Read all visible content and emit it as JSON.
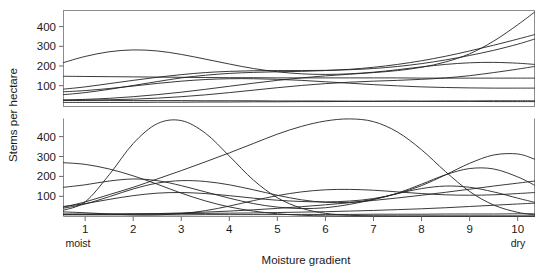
{
  "figure": {
    "title": "",
    "ylabel": "Stems per hectare",
    "xlabel": "Moisture gradient",
    "x_start_label": "moist",
    "x_end_label": "dry",
    "curve_color": "#232323",
    "frame_color": "#8d8d8d",
    "background": "#ffffff"
  },
  "axis": {
    "x_ticks": [
      "1",
      "2",
      "3",
      "4",
      "5",
      "6",
      "7",
      "8",
      "9",
      "10"
    ],
    "y_ticks_top": [
      "100",
      "200",
      "300",
      "400"
    ],
    "y_ticks_bottom": [
      "100",
      "200",
      "300",
      "400"
    ]
  },
  "chart_data": {
    "type": "line",
    "title": "",
    "xlabel": "Moisture gradient",
    "ylabel": "Stems per hectare",
    "xlim": [
      0.55,
      10.35
    ],
    "ylim": [
      0,
      470
    ],
    "grid": false,
    "legend": null,
    "x_tick_labels": [
      "1",
      "2",
      "3",
      "4",
      "5",
      "6",
      "7",
      "8",
      "9",
      "10"
    ],
    "x_tick_values": [
      1,
      2,
      3,
      4,
      5,
      6,
      7,
      8,
      9,
      10
    ],
    "x_axis_endpoints": {
      "left": "moist",
      "right": "dry"
    },
    "panels": [
      {
        "panel": "top",
        "ylim": [
          0,
          470
        ],
        "y_tick_values": [
          100,
          200,
          300,
          400
        ],
        "x": [
          0.55,
          1,
          1.5,
          2,
          2.5,
          3,
          3.5,
          4,
          4.5,
          5,
          5.5,
          6,
          6.5,
          7,
          7.5,
          8,
          8.5,
          9,
          9.5,
          10,
          10.35
        ],
        "series": [
          {
            "name": "top-curve-1",
            "values": [
              215,
              245,
              268,
              277,
              272,
              255,
              232,
              208,
              186,
              170,
              160,
              157,
              160,
              168,
              180,
              194,
              206,
              214,
              216,
              212,
              206
            ]
          },
          {
            "name": "top-curve-2",
            "values": [
              148,
              147,
              146,
              145,
              144,
              143,
              142,
              141,
              141,
              140,
              140,
              140,
              140,
              140,
              140,
              139,
              139,
              139,
              139,
              139,
              139
            ]
          },
          {
            "name": "top-curve-3",
            "values": [
              85,
              96,
              112,
              128,
              143,
              156,
              166,
              172,
              175,
              176,
              176,
              177,
              180,
              186,
              196,
              210,
              228,
              250,
              275,
              305,
              330
            ]
          },
          {
            "name": "top-curve-4",
            "values": [
              58,
              68,
              84,
              103,
              122,
              140,
              153,
              162,
              167,
              170,
              172,
              176,
              182,
              192,
              206,
              224,
              246,
              272,
              300,
              330,
              352
            ]
          },
          {
            "name": "top-curve-5",
            "values": [
              32,
              35,
              40,
              48,
              58,
              70,
              84,
              99,
              114,
              128,
              140,
              150,
              158,
              166,
              176,
              192,
              218,
              258,
              320,
              400,
              462
            ]
          },
          {
            "name": "top-curve-6",
            "values": [
              30,
              31,
              33,
              36,
              41,
              48,
              57,
              68,
              80,
              92,
              103,
              112,
              119,
              124,
              128,
              133,
              140,
              151,
              166,
              183,
              196
            ]
          },
          {
            "name": "top-curve-7",
            "values": [
              72,
              78,
              88,
              100,
              113,
              124,
              132,
              136,
              136,
              133,
              128,
              121,
              114,
              107,
              101,
              96,
              93,
              91,
              90,
              90,
              90
            ]
          },
          {
            "name": "top-curve-8",
            "values": [
              20,
              20,
              20,
              20,
              21,
              21,
              22,
              22,
              23,
              23,
              24,
              24,
              25,
              25,
              26,
              26,
              27,
              27,
              28,
              28,
              28
            ]
          },
          {
            "name": "top-curve-9",
            "values": [
              30,
              30,
              30,
              29,
              29,
              29,
              28,
              28,
              28,
              27,
              27,
              27,
              26,
              26,
              26,
              25,
              25,
              25,
              24,
              24,
              24
            ]
          }
        ]
      },
      {
        "panel": "bottom",
        "ylim": [
          0,
          470
        ],
        "y_tick_values": [
          100,
          200,
          300,
          400
        ],
        "x": [
          0.55,
          1,
          1.5,
          2,
          2.5,
          3,
          3.5,
          4,
          4.5,
          5,
          5.5,
          6,
          6.5,
          7,
          7.5,
          8,
          8.5,
          9,
          9.5,
          10,
          10.35
        ],
        "series": [
          {
            "name": "bottom-curve-1",
            "values": [
              30,
              70,
              200,
              350,
              445,
              460,
              400,
              290,
              175,
              90,
              40,
              15,
              6,
              3,
              2,
              2,
              2,
              2,
              2,
              2,
              2
            ]
          },
          {
            "name": "bottom-curve-2",
            "values": [
              45,
              70,
              105,
              140,
              180,
              220,
              262,
              305,
              350,
              395,
              432,
              458,
              468,
              455,
              405,
              320,
              215,
              120,
              55,
              20,
              8
            ]
          },
          {
            "name": "bottom-curve-3",
            "values": [
              258,
              250,
              228,
              195,
              155,
              112,
              75,
              46,
              26,
              13,
              6,
              3,
              2,
              2,
              2,
              2,
              2,
              2,
              2,
              2,
              2
            ]
          },
          {
            "name": "bottom-curve-4",
            "values": [
              140,
              152,
              170,
              180,
              172,
              148,
              118,
              88,
              62,
              45,
              38,
              42,
              58,
              82,
              110,
              134,
              146,
              140,
              118,
              88,
              68
            ]
          },
          {
            "name": "bottom-curve-5",
            "values": [
              40,
              60,
              95,
              132,
              160,
              172,
              168,
              152,
              128,
              102,
              80,
              68,
              68,
              82,
              112,
              155,
              200,
              230,
              228,
              190,
              150
            ]
          },
          {
            "name": "bottom-curve-6",
            "values": [
              48,
              62,
              82,
              100,
              112,
              115,
              110,
              100,
              88,
              78,
              72,
              70,
              74,
              86,
              110,
              148,
              200,
              255,
              295,
              300,
              275
            ]
          },
          {
            "name": "bottom-curve-7",
            "values": [
              22,
              18,
              12,
              8,
              8,
              14,
              28,
              50,
              76,
              100,
              118,
              128,
              130,
              126,
              118,
              110,
              104,
              102,
              104,
              110,
              115
            ]
          },
          {
            "name": "bottom-curve-8",
            "values": [
              10,
              10,
              11,
              12,
              14,
              17,
              21,
              26,
              32,
              39,
              47,
              56,
              66,
              77,
              89,
              102,
              116,
              131,
              146,
              160,
              170
            ]
          },
          {
            "name": "bottom-curve-9",
            "values": [
              12,
              12,
              12,
              13,
              13,
              14,
              15,
              16,
              17,
              19,
              21,
              23,
              26,
              29,
              33,
              37,
              42,
              48,
              54,
              60,
              64
            ]
          },
          {
            "name": "bottom-curve-10",
            "values": [
              8,
              8,
              8,
              8,
              8,
              8,
              9,
              9,
              9,
              9,
              10,
              10,
              10,
              11,
              11,
              11,
              12,
              12,
              12,
              13,
              13
            ]
          }
        ]
      }
    ]
  }
}
